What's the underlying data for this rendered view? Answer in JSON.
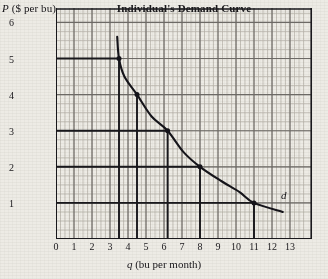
{
  "chart_data": {
    "type": "line",
    "title": "Individual's Demand Curve",
    "xlabel": "q (bu per month)",
    "ylabel": "P ($ per bu)",
    "xlabel_italic_symbol": "q",
    "xlabel_rest": " (bu per month)",
    "ylabel_italic_symbol": "P",
    "ylabel_rest": " ($ per bu)",
    "xlim": [
      0,
      13.8
    ],
    "ylim": [
      0,
      6.4
    ],
    "xticks": [
      0,
      1,
      2,
      3,
      4,
      5,
      6,
      7,
      8,
      9,
      10,
      11,
      12,
      13
    ],
    "yticks": [
      1,
      2,
      3,
      4,
      5,
      6
    ],
    "grid": true,
    "minor_grid": true,
    "minor_subdivisions": 4,
    "legend": "none",
    "series": [
      {
        "name": "d",
        "label": "d",
        "label_at": {
          "q": 12.5,
          "P": 1.15
        },
        "points": [
          {
            "q": 3.4,
            "P": 5.6
          },
          {
            "q": 3.5,
            "P": 5.0
          },
          {
            "q": 3.8,
            "P": 4.5
          },
          {
            "q": 4.5,
            "P": 4.0
          },
          {
            "q": 5.3,
            "P": 3.4
          },
          {
            "q": 6.2,
            "P": 3.0
          },
          {
            "q": 7.1,
            "P": 2.4
          },
          {
            "q": 8.0,
            "P": 2.0
          },
          {
            "q": 9.2,
            "P": 1.6
          },
          {
            "q": 10.2,
            "P": 1.3
          },
          {
            "q": 11.0,
            "P": 1.0
          },
          {
            "q": 12.6,
            "P": 0.75
          }
        ]
      }
    ],
    "marked_points": [
      {
        "q": 3.5,
        "P": 5
      },
      {
        "q": 4.5,
        "P": 4
      },
      {
        "q": 6.2,
        "P": 3
      },
      {
        "q": 8.0,
        "P": 2
      },
      {
        "q": 11.0,
        "P": 1
      }
    ],
    "reference_lines": {
      "horizontal_from_axis": [
        {
          "P": 5,
          "to_q": 3.5
        },
        {
          "P": 3,
          "to_q": 6.2
        },
        {
          "P": 2,
          "to_q": 8.0
        },
        {
          "P": 1,
          "to_q": 11.0
        }
      ],
      "vertical_to_axis": [
        {
          "q": 3.5,
          "from_P": 5
        },
        {
          "q": 4.5,
          "from_P": 4
        },
        {
          "q": 6.2,
          "from_P": 3
        },
        {
          "q": 8.0,
          "from_P": 2
        },
        {
          "q": 11.0,
          "from_P": 1
        }
      ]
    },
    "colors": {
      "curve": "#15141a",
      "grid_major": "#6d6a66",
      "grid_minor": "#b4b0a8",
      "axis": "#19181c",
      "paper": "#edebe5"
    }
  }
}
